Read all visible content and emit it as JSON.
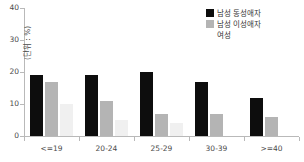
{
  "chart_data": {
    "type": "bar",
    "title": "",
    "xlabel": "",
    "ylabel": "(단위 : %)",
    "ylim": [
      0,
      40
    ],
    "yticks": [
      0,
      10,
      20,
      30,
      40
    ],
    "grid": false,
    "legend_position": "top-right",
    "categories": [
      "<=19",
      "20-24",
      "25-29",
      "30-39",
      ">=40"
    ],
    "series": [
      {
        "name": "남성 동성애자",
        "color": "#0d0d0d",
        "values": [
          19,
          19,
          20,
          17,
          12
        ]
      },
      {
        "name": "남성 이성애자",
        "color": "#b4b4b4",
        "values": [
          17,
          11,
          7,
          7,
          6
        ]
      },
      {
        "name": "여성",
        "color": "#f0f0f0",
        "values": [
          10,
          5,
          4,
          0,
          0
        ]
      }
    ]
  },
  "axis": {
    "ytick_labels": [
      "0",
      "10",
      "20",
      "30",
      "40"
    ]
  },
  "legend": {
    "items": [
      {
        "label": "남성 동성애자"
      },
      {
        "label": "남성 이성애자"
      },
      {
        "label": "여성"
      }
    ]
  }
}
